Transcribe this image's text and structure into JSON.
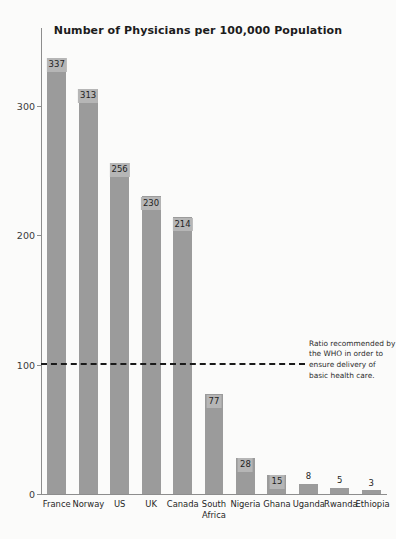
{
  "chart_data": {
    "type": "bar",
    "title": "Number of Physicians per 100,000 Population",
    "xlabel": "",
    "ylabel": "",
    "ylim": [
      0,
      360
    ],
    "grid": false,
    "legend": "none",
    "categories": [
      "France",
      "Norway",
      "US",
      "UK",
      "Canada",
      "South\nAfrica",
      "Nigeria",
      "Ghana",
      "Uganda",
      "Rwanda",
      "Ethiopia"
    ],
    "values": [
      337,
      313,
      256,
      230,
      214,
      77,
      28,
      15,
      8,
      5,
      3
    ],
    "yticks": [
      0,
      100,
      200,
      300
    ],
    "ytick_labels": [
      "0",
      "100",
      "200",
      "300"
    ],
    "bar_color": "#9b9b9b",
    "value_label_bg": "#b6b6b6",
    "reference_line": {
      "value": 100,
      "style": "dashed",
      "color": "#1a1a1a",
      "annotation": "Ratio recommended by the WHO in order to ensure delivery of basic health care."
    }
  }
}
